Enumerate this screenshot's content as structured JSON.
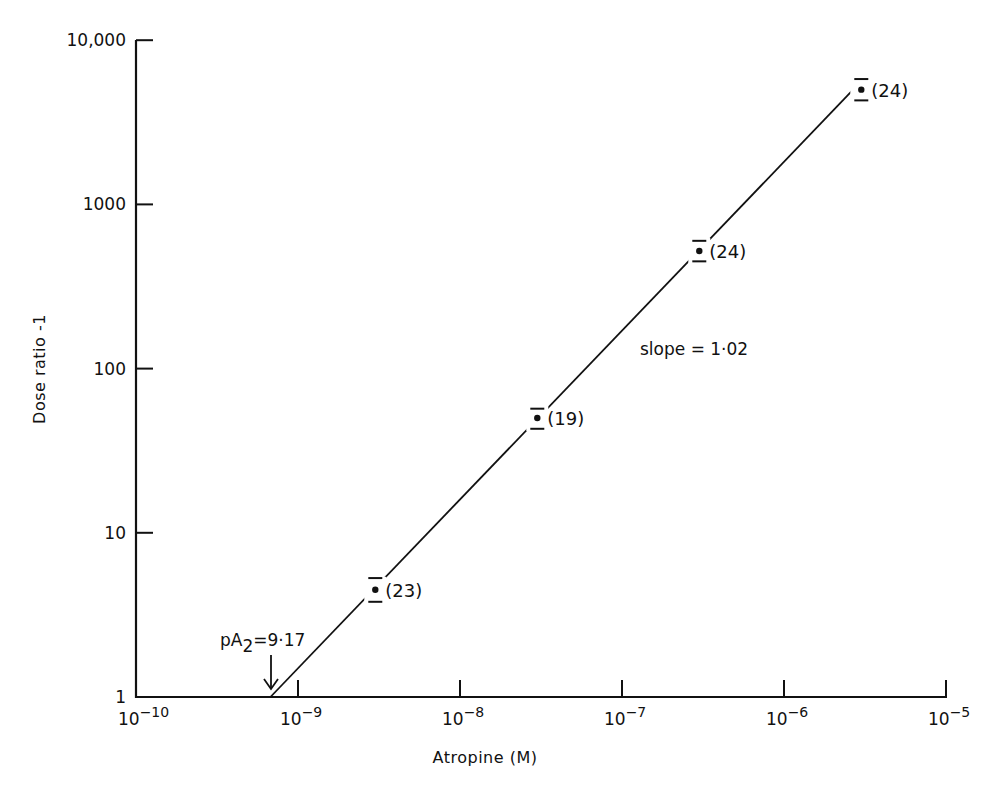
{
  "chart_data": {
    "type": "scatter",
    "title": "",
    "xlabel": "Atropine (M)",
    "ylabel": "Dose ratio -1",
    "xscale": "log",
    "yscale": "log",
    "xlim": [
      1e-10,
      1e-05
    ],
    "ylim": [
      1,
      10000
    ],
    "grid": false,
    "legend": null,
    "x_ticks": [
      {
        "value": 1e-10,
        "base": "10",
        "exp": "−10"
      },
      {
        "value": 1e-09,
        "base": "10",
        "exp": "−9"
      },
      {
        "value": 1e-08,
        "base": "10",
        "exp": "−8"
      },
      {
        "value": 1e-07,
        "base": "10",
        "exp": "−7"
      },
      {
        "value": 1e-06,
        "base": "10",
        "exp": "−6"
      },
      {
        "value": 1e-05,
        "base": "10",
        "exp": "−5"
      }
    ],
    "y_ticks": [
      {
        "value": 1,
        "label": "1"
      },
      {
        "value": 10,
        "label": "10"
      },
      {
        "value": 100,
        "label": "100"
      },
      {
        "value": 1000,
        "label": "1000"
      },
      {
        "value": 10000,
        "label": "10,000"
      }
    ],
    "series": [
      {
        "name": "Atropine Schild plot",
        "points": [
          {
            "x": 3e-09,
            "y": 4.5,
            "err_low": 3.8,
            "err_high": 5.3,
            "n": 23,
            "n_label": "(23)"
          },
          {
            "x": 3e-08,
            "y": 50,
            "err_low": 43,
            "err_high": 57,
            "n": 19,
            "n_label": "(19)"
          },
          {
            "x": 3e-07,
            "y": 520,
            "err_low": 450,
            "err_high": 600,
            "n": 24,
            "n_label": "(24)"
          },
          {
            "x": 3e-06,
            "y": 5000,
            "err_low": 4300,
            "err_high": 5800,
            "n": 24,
            "n_label": "(24)"
          }
        ]
      }
    ],
    "regression_line": {
      "slope": 1.02,
      "x_start": 6.76e-10,
      "y_start": 1,
      "x_end": 3e-06,
      "y_end": 5300
    },
    "annotations": [
      {
        "text_main": "pA",
        "text_sub": "2",
        "text_rest": "=9·17",
        "x": 6.76e-10,
        "arrow": true
      },
      {
        "text": "slope = 1·02"
      }
    ]
  }
}
